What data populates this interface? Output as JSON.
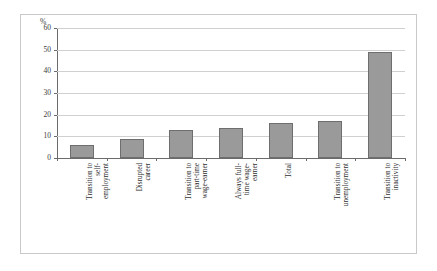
{
  "chart_data": {
    "type": "bar",
    "title": "",
    "xlabel": "",
    "ylabel": "%",
    "ylim": [
      0,
      60
    ],
    "ytick_values": [
      0,
      10,
      20,
      30,
      40,
      50,
      60
    ],
    "ytick_labels": [
      "0",
      "10",
      "20",
      "30",
      "40",
      "50",
      "60"
    ],
    "grid": true,
    "legend": false,
    "categories": [
      "Transition to self-employment",
      "Disrupted career",
      "Transition to part-time wage-earner",
      "Always full-time wage-earner",
      "Total",
      "Transition to unemployment",
      "Transition to inactivity"
    ],
    "category_label_lines": [
      "Transition to\nself-\nemployment",
      "Disrupted\ncareer",
      "Transition to\npart-time\nwage-earner",
      "Always full-\ntime wage-\nearner",
      "Total",
      "Transition to\nunemployment",
      "Transition to\ninactivity"
    ],
    "values": [
      6,
      9,
      13,
      14,
      16,
      17,
      49
    ],
    "series": [
      {
        "name": "share",
        "values": [
          6,
          9,
          13,
          14,
          16,
          17,
          49
        ]
      }
    ],
    "colors": {
      "bar_fill": "#9a9a9a",
      "bar_edge": "#6e6e6e",
      "gridline": "#d0d0d0",
      "axis": "#6b6b6b",
      "frame": "#c9c9c9",
      "background": "#ffffff",
      "text": "#2e2e2e"
    }
  }
}
